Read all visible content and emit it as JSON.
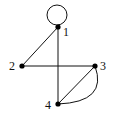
{
  "diagram": {
    "type": "graph",
    "colors": {
      "stroke": "#111111",
      "node": "#000000",
      "background": "#ffffff"
    },
    "nodes": [
      {
        "id": "1",
        "label": "1",
        "x": 58,
        "y": 27
      },
      {
        "id": "2",
        "label": "2",
        "x": 22,
        "y": 66
      },
      {
        "id": "3",
        "label": "3",
        "x": 95,
        "y": 66
      },
      {
        "id": "4",
        "label": "4",
        "x": 58,
        "y": 104
      }
    ],
    "edges": [
      {
        "from": "1",
        "to": "1",
        "kind": "loop"
      },
      {
        "from": "1",
        "to": "2",
        "kind": "straight"
      },
      {
        "from": "1",
        "to": "4",
        "kind": "straight"
      },
      {
        "from": "2",
        "to": "3",
        "kind": "straight"
      },
      {
        "from": "3",
        "to": "4",
        "kind": "straight"
      },
      {
        "from": "3",
        "to": "4",
        "kind": "curved"
      }
    ]
  }
}
